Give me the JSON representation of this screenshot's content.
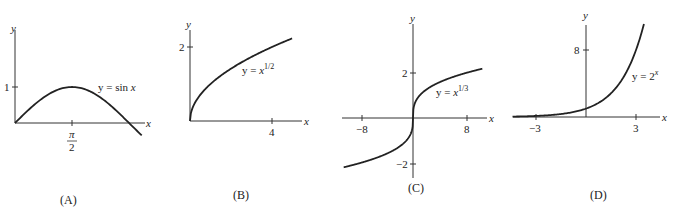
{
  "chart_data": [
    {
      "type": "line",
      "panel": "(A)",
      "function_label": "y = sin x",
      "xlabel": "x",
      "ylabel": "y",
      "x_ticks": [
        "π/2"
      ],
      "y_ticks": [
        "1"
      ],
      "x_range": [
        0,
        3.5
      ],
      "y_range": [
        -0.4,
        2.7
      ],
      "series": [
        {
          "name": "y = sin x",
          "x": [
            0,
            0.3927,
            0.7854,
            1.1781,
            1.5708,
            1.9635,
            2.3562,
            2.7489,
            3.1416,
            3.45
          ],
          "y": [
            0,
            0.383,
            0.707,
            0.924,
            1,
            0.924,
            0.707,
            0.383,
            0,
            -0.303
          ]
        }
      ]
    },
    {
      "type": "line",
      "panel": "(B)",
      "function_label": "y = x^1/2",
      "xlabel": "x",
      "ylabel": "y",
      "x_ticks": [
        "4"
      ],
      "y_ticks": [
        "2"
      ],
      "x_range": [
        0,
        5.2
      ],
      "y_range": [
        0,
        2.7
      ],
      "series": [
        {
          "name": "y = x^1/2",
          "x": [
            0,
            0.25,
            0.5,
            1,
            2,
            3,
            4,
            5
          ],
          "y": [
            0,
            0.5,
            0.707,
            1,
            1.414,
            1.732,
            2,
            2.236
          ]
        }
      ]
    },
    {
      "type": "line",
      "panel": "(C)",
      "function_label": "y = x^1/3",
      "xlabel": "x",
      "ylabel": "y",
      "x_ticks": [
        "-8",
        "8"
      ],
      "y_ticks": [
        "2",
        "-2"
      ],
      "x_range": [
        -12,
        12
      ],
      "y_range": [
        -3,
        3.3
      ],
      "series": [
        {
          "name": "y = x^1/3",
          "x": [
            -10.5,
            -8,
            -4,
            -1,
            -0.125,
            0,
            0.125,
            1,
            4,
            8,
            10.5
          ],
          "y": [
            -2.19,
            -2,
            -1.587,
            -1,
            -0.5,
            0,
            0.5,
            1,
            1.587,
            2,
            2.19
          ]
        }
      ]
    },
    {
      "type": "line",
      "panel": "(D)",
      "function_label": "y = 2^x",
      "xlabel": "x",
      "ylabel": "y",
      "x_ticks": [
        "-3",
        "3"
      ],
      "y_ticks": [
        "8"
      ],
      "x_range": [
        -4.4,
        4.4
      ],
      "y_range": [
        0,
        13
      ],
      "series": [
        {
          "name": "y = 2^x",
          "x": [
            -4.4,
            -3,
            -2,
            -1,
            0,
            1,
            2,
            3,
            3.5
          ],
          "y": [
            0.047,
            0.125,
            0.25,
            0.5,
            1,
            2,
            4,
            8,
            11.31
          ]
        }
      ]
    }
  ],
  "panels": {
    "a": {
      "caption": "(A)",
      "ylabel": "y",
      "xlabel": "x",
      "ytick": "1",
      "xtick_num": "π",
      "xtick_den": "2",
      "fn_prefix": "y = sin ",
      "fn_var": "x"
    },
    "b": {
      "caption": "(B)",
      "ylabel": "y",
      "xlabel": "x",
      "ytick": "2",
      "xtick": "4",
      "fn_prefix": "y = ",
      "fn_var": "x",
      "fn_exp": "1/2"
    },
    "c": {
      "caption": "(C)",
      "ylabel": "y",
      "xlabel": "x",
      "ytick_pos": "2",
      "ytick_neg": "−2",
      "xtick_neg": "−8",
      "xtick_pos": "8",
      "fn_prefix": "y = ",
      "fn_var": "x",
      "fn_exp": "1/3"
    },
    "d": {
      "caption": "(D)",
      "ylabel": "y",
      "xlabel": "x",
      "ytick": "8",
      "xtick_neg": "−3",
      "xtick_pos": "3",
      "fn_prefix": "y = 2",
      "fn_exp": "x"
    }
  }
}
